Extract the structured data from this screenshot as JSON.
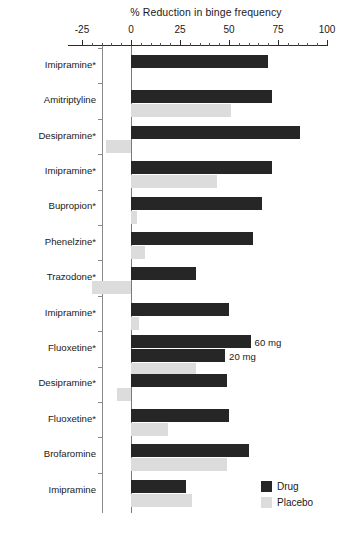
{
  "chart_data": {
    "type": "bar",
    "orientation": "horizontal",
    "title": "% Reduction in binge frequency",
    "xlabel": "% Reduction in binge frequency",
    "ylabel": "",
    "xlim": [
      -25,
      100
    ],
    "xticks": [
      -25,
      0,
      25,
      50,
      75,
      100
    ],
    "xtick_labels": [
      "-25",
      "0",
      "25",
      "50",
      "75",
      "100"
    ],
    "grid": false,
    "legend_position": "bottom-right",
    "legend": [
      "Drug",
      "Placebo"
    ],
    "categories": [
      "Imipramine*",
      "Amitriptyline",
      "Desipramine*",
      "Imipramine*",
      "Bupropion*",
      "Phenelzine*",
      "Trazodone*",
      "Imipramine*",
      "Fluoxetine*",
      "Desipramine*",
      "Fluoxetine*",
      "Brofaromine",
      "Imipramine"
    ],
    "series": [
      {
        "name": "Drug",
        "color": "#262626",
        "values": [
          70,
          72,
          86,
          72,
          67,
          62,
          33,
          50,
          61,
          49,
          50,
          60,
          28
        ]
      },
      {
        "name": "Placebo",
        "color": "#dcdcdc",
        "values": [
          0,
          51,
          -13,
          44,
          3,
          7,
          -20,
          4,
          33,
          -7,
          19,
          49,
          31
        ]
      }
    ],
    "annotations": [
      {
        "label": "60 mg",
        "category": "Fluoxetine*",
        "series": "Drug",
        "value": 61
      },
      {
        "label": "20 mg",
        "category": "Fluoxetine*",
        "series": "Drug-secondary",
        "value": 48
      }
    ],
    "extra_bars": [
      {
        "category_index": 8,
        "series": "Drug",
        "value": 48,
        "note": "20 mg dose bar"
      },
      {
        "category_index": 8,
        "series": "Placebo",
        "value": 33,
        "note": "placebo for fluoxetine trial"
      }
    ]
  },
  "legend": {
    "drug_label": "Drug",
    "placebo_label": "Placebo"
  },
  "axis": {
    "title": "% Reduction in binge frequency",
    "ticks": [
      "-25",
      "0",
      "25",
      "50",
      "75",
      "100"
    ]
  }
}
